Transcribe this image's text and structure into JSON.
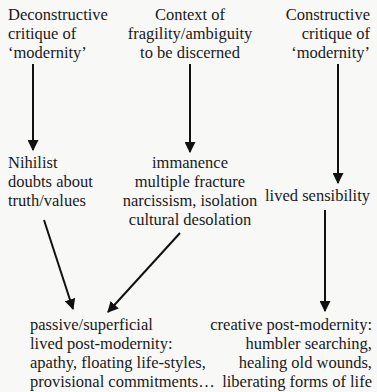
{
  "diagram": {
    "title_partial": "",
    "nodes": {
      "deconstructive": {
        "lines": [
          "Deconstructive",
          "critique of",
          "‘modernity’"
        ]
      },
      "context": {
        "lines": [
          "Context of",
          "fragility/ambiguity",
          "to be discerned"
        ]
      },
      "constructive": {
        "lines": [
          "Constructive",
          "critique of",
          "‘modernity’"
        ]
      },
      "nihilist": {
        "lines": [
          "Nihilist",
          "doubts about",
          "truth/values"
        ]
      },
      "immanence": {
        "lines": [
          "immanence",
          "multiple fracture",
          "narcissism, isolation",
          "cultural desolation"
        ]
      },
      "lived_sensibility": {
        "lines": [
          "lived sensibility"
        ]
      },
      "passive": {
        "lines": [
          "passive/superficial",
          "lived post-modernity:",
          "apathy, floating life-styles,",
          "provisional commitments…"
        ]
      },
      "creative": {
        "lines": [
          "creative post-modernity:",
          "humbler searching,",
          "healing old wounds,",
          "liberating forms of life"
        ]
      }
    },
    "edges": [
      {
        "from": "deconstructive",
        "to": "nihilist"
      },
      {
        "from": "context",
        "to": "immanence"
      },
      {
        "from": "constructive",
        "to": "lived_sensibility"
      },
      {
        "from": "nihilist",
        "to": "passive"
      },
      {
        "from": "immanence",
        "to": "passive"
      },
      {
        "from": "lived_sensibility",
        "to": "creative"
      }
    ],
    "colors": {
      "background": "#f8f8f7",
      "text": "#1a1a1a",
      "arrow": "#111111"
    }
  }
}
